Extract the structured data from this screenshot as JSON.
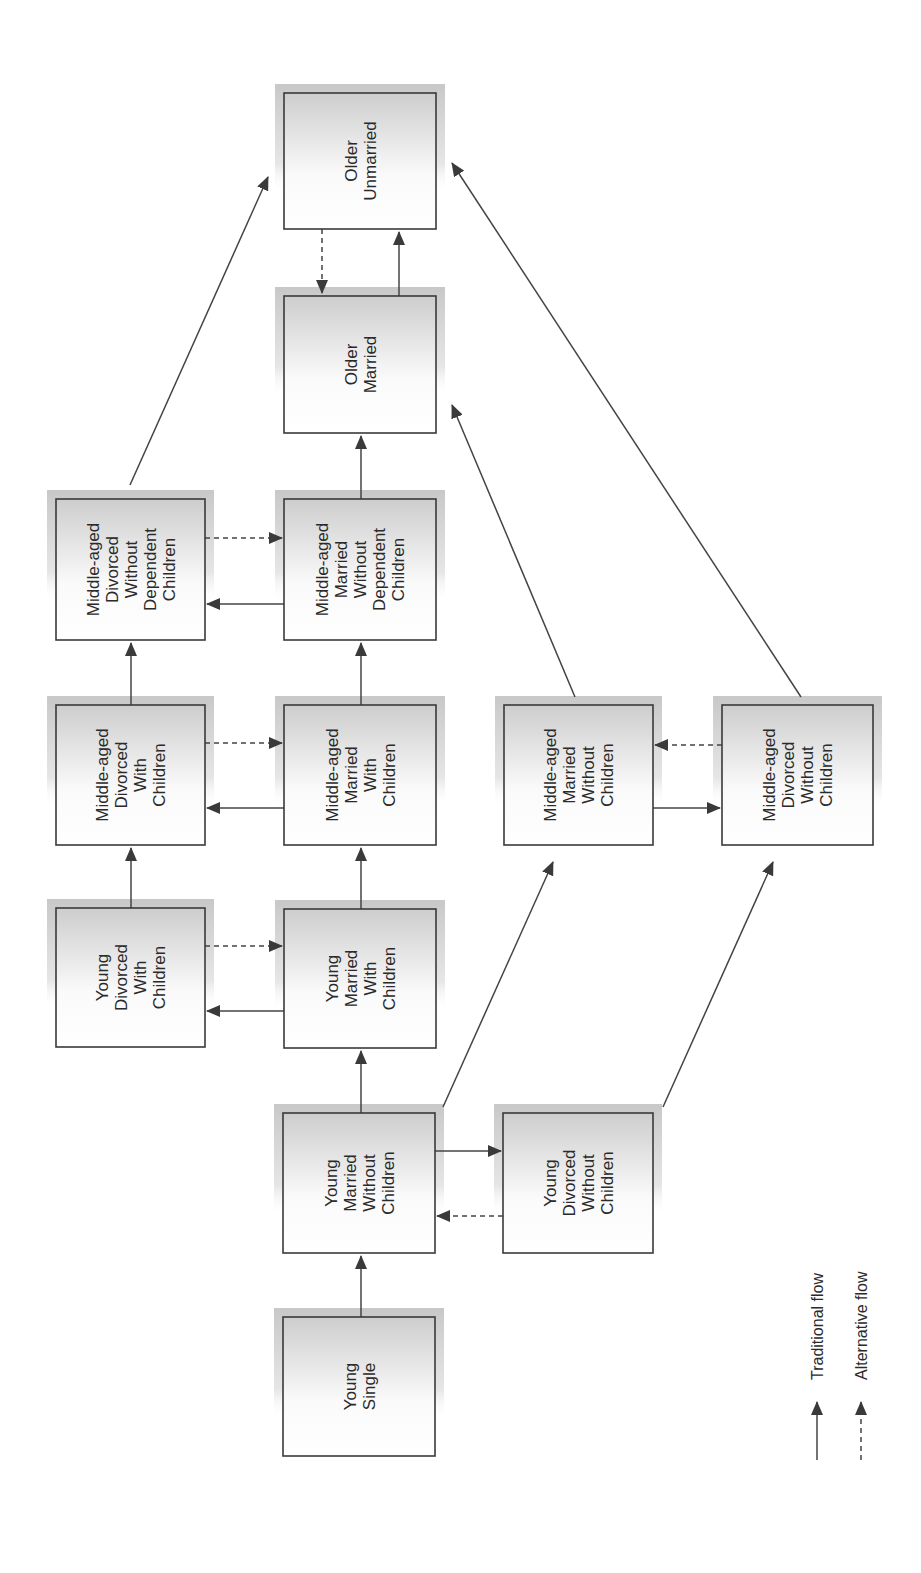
{
  "nodes": {
    "young_single": {
      "label_lines": [
        "Young",
        "Single"
      ],
      "x": 283,
      "y": 1317,
      "w": 152,
      "h": 139
    },
    "young_married_without_children": {
      "label_lines": [
        "Young",
        "Married",
        "Without",
        "Children"
      ],
      "x": 283,
      "y": 1113,
      "w": 152,
      "h": 140
    },
    "young_divorced_without_children": {
      "label_lines": [
        "Young",
        "Divorced",
        "Without",
        "Children"
      ],
      "x": 503,
      "y": 1113,
      "w": 150,
      "h": 140
    },
    "young_married_with_children": {
      "label_lines": [
        "Young",
        "Married",
        "With",
        "Children"
      ],
      "x": 284,
      "y": 909,
      "w": 152,
      "h": 139
    },
    "young_divorced_with_children": {
      "label_lines": [
        "Young",
        "Divorced",
        "With",
        "Children"
      ],
      "x": 56,
      "y": 908,
      "w": 149,
      "h": 139
    },
    "middle_aged_married_with_children": {
      "label_lines": [
        "Middle-aged",
        "Married",
        "With",
        "Children"
      ],
      "x": 284,
      "y": 705,
      "w": 152,
      "h": 140
    },
    "middle_aged_divorced_with_children": {
      "label_lines": [
        "Middle-aged",
        "Divorced",
        "With",
        "Children"
      ],
      "x": 56,
      "y": 705,
      "w": 149,
      "h": 140
    },
    "middle_aged_married_without_children": {
      "label_lines": [
        "Middle-aged",
        "Married",
        "Without",
        "Children"
      ],
      "x": 504,
      "y": 705,
      "w": 149,
      "h": 140
    },
    "middle_aged_divorced_without_children": {
      "label_lines": [
        "Middle-aged",
        "Divorced",
        "Without",
        "Children"
      ],
      "x": 722,
      "y": 705,
      "w": 151,
      "h": 140
    },
    "middle_aged_married_without_dependent_children": {
      "label_lines": [
        "Middle-aged",
        "Married",
        "Without",
        "Dependent",
        "Children"
      ],
      "x": 284,
      "y": 499,
      "w": 152,
      "h": 141
    },
    "middle_aged_divorced_without_dependent_children": {
      "label_lines": [
        "Middle-aged",
        "Divorced",
        "Without",
        "Dependent",
        "Children"
      ],
      "x": 56,
      "y": 499,
      "w": 149,
      "h": 141
    },
    "older_married": {
      "label_lines": [
        "Older",
        "Married"
      ],
      "x": 284,
      "y": 296,
      "w": 152,
      "h": 137
    },
    "older_unmarried": {
      "label_lines": [
        "Older",
        "Unmarried"
      ],
      "x": 284,
      "y": 93,
      "w": 152,
      "h": 136
    }
  },
  "edges": [
    {
      "from": "young_single",
      "to": "young_married_without_children",
      "type": "traditional",
      "points": [
        [
          361,
          1317
        ],
        [
          361,
          1256
        ]
      ]
    },
    {
      "from": "young_married_without_children",
      "to": "young_divorced_without_children",
      "type": "traditional",
      "points": [
        [
          435,
          1151
        ],
        [
          501,
          1151
        ]
      ]
    },
    {
      "from": "young_divorced_without_children",
      "to": "young_married_without_children",
      "type": "alternative",
      "points": [
        [
          503,
          1216
        ],
        [
          437,
          1216
        ]
      ]
    },
    {
      "from": "young_married_without_children",
      "to": "young_married_with_children",
      "type": "traditional",
      "points": [
        [
          361,
          1113
        ],
        [
          361,
          1051
        ]
      ]
    },
    {
      "from": "young_married_without_children",
      "to": "middle_aged_married_without_children",
      "type": "traditional",
      "points": [
        [
          443,
          1107
        ],
        [
          553,
          862
        ]
      ]
    },
    {
      "from": "young_divorced_without_children",
      "to": "middle_aged_divorced_without_children",
      "type": "traditional",
      "points": [
        [
          663,
          1107
        ],
        [
          773,
          862
        ]
      ]
    },
    {
      "from": "young_married_with_children",
      "to": "young_divorced_with_children",
      "type": "traditional",
      "points": [
        [
          284,
          1011
        ],
        [
          207,
          1011
        ]
      ]
    },
    {
      "from": "young_divorced_with_children",
      "to": "young_married_with_children",
      "type": "alternative",
      "points": [
        [
          205,
          946
        ],
        [
          282,
          946
        ]
      ]
    },
    {
      "from": "young_married_with_children",
      "to": "middle_aged_married_with_children",
      "type": "traditional",
      "points": [
        [
          361,
          909
        ],
        [
          361,
          848
        ]
      ]
    },
    {
      "from": "young_divorced_with_children",
      "to": "middle_aged_divorced_with_children",
      "type": "traditional",
      "points": [
        [
          131,
          908
        ],
        [
          131,
          848
        ]
      ]
    },
    {
      "from": "middle_aged_married_with_children",
      "to": "middle_aged_divorced_with_children",
      "type": "traditional",
      "points": [
        [
          284,
          808
        ],
        [
          207,
          808
        ]
      ]
    },
    {
      "from": "middle_aged_divorced_with_children",
      "to": "middle_aged_married_with_children",
      "type": "alternative",
      "points": [
        [
          205,
          743
        ],
        [
          282,
          743
        ]
      ]
    },
    {
      "from": "middle_aged_married_with_children",
      "to": "middle_aged_married_without_dependent_children",
      "type": "traditional",
      "points": [
        [
          361,
          705
        ],
        [
          361,
          643
        ]
      ]
    },
    {
      "from": "middle_aged_divorced_with_children",
      "to": "middle_aged_divorced_without_dependent_children",
      "type": "traditional",
      "points": [
        [
          131,
          705
        ],
        [
          131,
          643
        ]
      ]
    },
    {
      "from": "middle_aged_married_without_children",
      "to": "middle_aged_divorced_without_children",
      "type": "traditional",
      "points": [
        [
          653,
          808
        ],
        [
          720,
          808
        ]
      ]
    },
    {
      "from": "middle_aged_divorced_without_children",
      "to": "middle_aged_married_without_children",
      "type": "alternative",
      "points": [
        [
          722,
          745
        ],
        [
          655,
          745
        ]
      ]
    },
    {
      "from": "middle_aged_married_without_dependent_children",
      "to": "middle_aged_divorced_without_dependent_children",
      "type": "traditional",
      "points": [
        [
          284,
          604
        ],
        [
          207,
          604
        ]
      ]
    },
    {
      "from": "middle_aged_divorced_without_dependent_children",
      "to": "middle_aged_married_without_dependent_children",
      "type": "alternative",
      "points": [
        [
          205,
          538
        ],
        [
          282,
          538
        ]
      ]
    },
    {
      "from": "middle_aged_married_without_dependent_children",
      "to": "older_married",
      "type": "traditional",
      "points": [
        [
          361,
          499
        ],
        [
          361,
          436
        ]
      ]
    },
    {
      "from": "middle_aged_divorced_without_dependent_children",
      "to": "older_unmarried",
      "type": "traditional",
      "points": [
        [
          130,
          485
        ],
        [
          268,
          177
        ]
      ]
    },
    {
      "from": "middle_aged_married_without_children",
      "to": "older_married",
      "type": "traditional",
      "points": [
        [
          575,
          697
        ],
        [
          452,
          405
        ]
      ]
    },
    {
      "from": "middle_aged_divorced_without_children",
      "to": "older_unmarried",
      "type": "traditional",
      "points": [
        [
          801,
          697
        ],
        [
          452,
          163
        ]
      ]
    },
    {
      "from": "older_married",
      "to": "older_unmarried",
      "type": "traditional",
      "points": [
        [
          399,
          296
        ],
        [
          399,
          232
        ]
      ]
    },
    {
      "from": "older_unmarried",
      "to": "older_married",
      "type": "alternative",
      "points": [
        [
          322,
          229
        ],
        [
          322,
          293
        ]
      ]
    }
  ],
  "legend": {
    "traditional": {
      "label": "Traditional flow"
    },
    "alternative": {
      "label": "Alternative flow"
    }
  },
  "colors": {
    "stroke": "#3a3a3a",
    "shadow": "#c8c8c8",
    "box_top": "#cdcdcd",
    "box_bottom": "#ffffff"
  }
}
